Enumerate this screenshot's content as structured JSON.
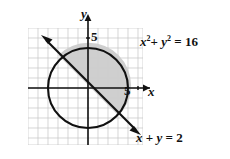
{
  "problem": {
    "number_label": "."
  },
  "figure": {
    "type": "coordinate-graph",
    "axes": {
      "x_label": "x",
      "y_label": "y",
      "x_tick_label": "5",
      "y_tick_label": "5",
      "x_tick_value": 5,
      "y_tick_value": 5,
      "x_range": [
        -6,
        5.5
      ],
      "y_range": [
        -5.5,
        6
      ],
      "grid": true,
      "grid_step": 1,
      "arrowheads": [
        "x-positive",
        "y-positive"
      ]
    },
    "curves": [
      {
        "name": "circle",
        "equation_label": "x² + y² = 16",
        "equation_parts": {
          "x_var": "x",
          "x_exp": "2",
          "plus": "+",
          "y_var": "y",
          "y_exp": "2",
          "equals": "=",
          "rhs": "16"
        },
        "center": [
          0,
          0
        ],
        "radius": 4,
        "stroke": "#111111"
      },
      {
        "name": "line",
        "equation_label": "x + y = 2",
        "equation_parts": {
          "x_var": "x",
          "plus": "+",
          "y_var": "y",
          "equals": "=",
          "rhs": "2"
        },
        "slope": -1,
        "intercept": 2,
        "stroke": "#111111",
        "arrowheads": [
          "upper-left",
          "lower-right"
        ]
      }
    ],
    "shaded_region": {
      "name": "circular-segment-above-line",
      "description": "region inside circle and above line",
      "fill": "#cfcfcf"
    },
    "colors": {
      "grid": "#c8c8c8",
      "axis": "#111111",
      "curve": "#111111",
      "shade": "#cfcfcf",
      "background": "#ffffff"
    }
  }
}
